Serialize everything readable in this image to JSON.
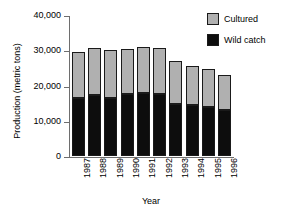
{
  "chart_data": {
    "type": "bar",
    "stacked": true,
    "title": "",
    "xlabel": "Year",
    "ylabel": "Production  (metric tons)",
    "categories": [
      "1987",
      "1988",
      "1989",
      "1990",
      "1991",
      "1992",
      "1993",
      "1994",
      "1995",
      "1996"
    ],
    "series": [
      {
        "name": "Wild catch",
        "color": "#0d0d0d",
        "values": [
          16600,
          17200,
          16500,
          17600,
          17900,
          17500,
          14800,
          14400,
          13800,
          13000
        ]
      },
      {
        "name": "Cultured",
        "color": "#b0b0b0",
        "values": [
          12800,
          13500,
          13600,
          12900,
          13100,
          13200,
          12300,
          11200,
          11000,
          10000
        ]
      }
    ],
    "totals": [
      29400,
      30700,
      30100,
      30500,
      31000,
      30700,
      27100,
      25600,
      24800,
      23000
    ],
    "ylim": [
      0,
      40000
    ],
    "yticks": [
      0,
      10000,
      20000,
      30000,
      40000
    ],
    "ytick_labels": [
      "0",
      "10,000",
      "20,000",
      "30,000",
      "40,000"
    ],
    "grid": false,
    "legend_position": "top-right",
    "legend": [
      {
        "label": "Cultured",
        "swatch": "#b0b0b0"
      },
      {
        "label": "Wild catch",
        "swatch": "#0d0d0d"
      }
    ]
  }
}
